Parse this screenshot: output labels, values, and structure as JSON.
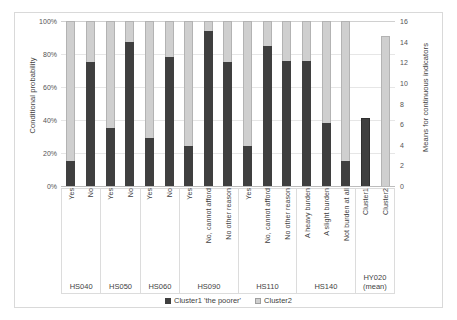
{
  "chart_data": {
    "type": "bar",
    "title": "",
    "subtitle": "",
    "stacked": true,
    "grid": true,
    "legend_position": "bottom",
    "ylabel": "Conditional probability",
    "ylabel_secondary": "Means for continuous indicators",
    "xlabel": "",
    "ylim": [
      0,
      100
    ],
    "ylim_secondary": [
      0,
      16
    ],
    "yticks": [
      "0%",
      "20%",
      "40%",
      "60%",
      "80%",
      "100%"
    ],
    "ytick_values": [
      0,
      20,
      40,
      60,
      80,
      100
    ],
    "yticks_secondary": [
      "0",
      "2",
      "4",
      "6",
      "8",
      "10",
      "12",
      "14",
      "16"
    ],
    "ytick_values_secondary": [
      0,
      2,
      4,
      6,
      8,
      10,
      12,
      14,
      16
    ],
    "legend": [
      {
        "label": "Cluster1  'the poorer'",
        "color": "#3f3f3f",
        "swatch": "dark"
      },
      {
        "label": "Cluster2",
        "color": "#cfcfcf",
        "swatch": "light"
      }
    ],
    "series": [
      {
        "name": "Cluster1 'the poorer'",
        "color": "#3f3f3f"
      },
      {
        "name": "Cluster2",
        "color": "#cfcfcf"
      }
    ],
    "groups": [
      {
        "label": "HS040",
        "sub": "",
        "span": 2
      },
      {
        "label": "HS050",
        "sub": "",
        "span": 2
      },
      {
        "label": "HS060",
        "sub": "",
        "span": 2
      },
      {
        "label": "HS090",
        "sub": "",
        "span": 3
      },
      {
        "label": "HS110",
        "sub": "",
        "span": 3
      },
      {
        "label": "HS140",
        "sub": "",
        "span": 3
      },
      {
        "label": "HY020",
        "sub": "(mean)",
        "span": 2
      }
    ],
    "categories": [
      "Yes",
      "No",
      "Yes",
      "No",
      "Yes",
      "No",
      "Yes",
      "No, cannot afford",
      "No other reason",
      "Yes",
      "No, cannot afford",
      "No other reason",
      "A heavy burden",
      "A slight burden",
      "Not burden at all",
      "Cluster1",
      "Cluster2"
    ],
    "bars": [
      {
        "category": "Yes",
        "group": "HS040",
        "axis": "left",
        "cluster1": 15,
        "cluster2": 85,
        "single": false
      },
      {
        "category": "No",
        "group": "HS040",
        "axis": "left",
        "cluster1": 75,
        "cluster2": 25,
        "single": false
      },
      {
        "category": "Yes",
        "group": "HS050",
        "axis": "left",
        "cluster1": 35,
        "cluster2": 65,
        "single": false
      },
      {
        "category": "No",
        "group": "HS050",
        "axis": "left",
        "cluster1": 87,
        "cluster2": 13,
        "single": false
      },
      {
        "category": "Yes",
        "group": "HS060",
        "axis": "left",
        "cluster1": 29,
        "cluster2": 71,
        "single": false
      },
      {
        "category": "No",
        "group": "HS060",
        "axis": "left",
        "cluster1": 78,
        "cluster2": 22,
        "single": false
      },
      {
        "category": "Yes",
        "group": "HS090",
        "axis": "left",
        "cluster1": 24,
        "cluster2": 76,
        "single": false
      },
      {
        "category": "No, cannot afford",
        "group": "HS090",
        "axis": "left",
        "cluster1": 94,
        "cluster2": 6,
        "single": false
      },
      {
        "category": "No other reason",
        "group": "HS090",
        "axis": "left",
        "cluster1": 75,
        "cluster2": 25,
        "single": false
      },
      {
        "category": "Yes",
        "group": "HS110",
        "axis": "left",
        "cluster1": 24,
        "cluster2": 76,
        "single": false
      },
      {
        "category": "No, cannot afford",
        "group": "HS110",
        "axis": "left",
        "cluster1": 85,
        "cluster2": 15,
        "single": false
      },
      {
        "category": "No other reason",
        "group": "HS110",
        "axis": "left",
        "cluster1": 76,
        "cluster2": 24,
        "single": false
      },
      {
        "category": "A heavy burden",
        "group": "HS140",
        "axis": "left",
        "cluster1": 76,
        "cluster2": 24,
        "single": false
      },
      {
        "category": "A slight burden",
        "group": "HS140",
        "axis": "left",
        "cluster1": 38,
        "cluster2": 62,
        "single": false
      },
      {
        "category": "Not burden at all",
        "group": "HS140",
        "axis": "left",
        "cluster1": 15,
        "cluster2": 85,
        "single": false
      },
      {
        "category": "Cluster1",
        "group": "HY020",
        "axis": "right",
        "value": 6.6,
        "series": "cluster1",
        "single": true
      },
      {
        "category": "Cluster2",
        "group": "HY020",
        "axis": "right",
        "value": 14.5,
        "series": "cluster2",
        "single": true
      }
    ]
  }
}
